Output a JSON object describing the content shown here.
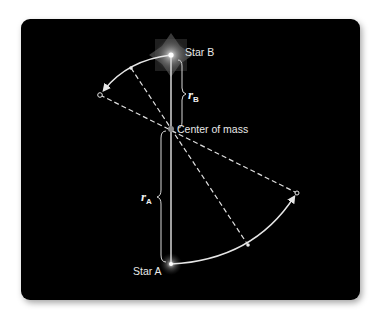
{
  "figure": {
    "type": "binary star orbit about center of mass",
    "background_color": "#000000",
    "line_color": "#e6e6e6"
  },
  "labels": {
    "star_b": "Star B",
    "star_a": "Star A",
    "center_of_mass": "Center of mass",
    "r_b_symbol": "r",
    "r_b_subscript": "B",
    "r_a_symbol": "r",
    "r_a_subscript": "A"
  },
  "geometry": {
    "star_b": [
      171,
      55
    ],
    "center_of_mass": [
      171,
      129
    ],
    "star_a": [
      171,
      264
    ],
    "star_b_later_position": [
      100,
      95
    ],
    "star_a_later_position": [
      297,
      193
    ],
    "intermediate_b": [
      131,
      68
    ],
    "intermediate_a": [
      248,
      245
    ]
  }
}
